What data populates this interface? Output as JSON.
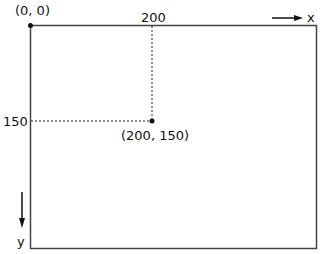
{
  "diagram": {
    "type": "screen coordinate system",
    "origin_label": "(0, 0)",
    "x_tick_label": "200",
    "y_tick_label": "150",
    "point_label": "(200, 150)",
    "x_axis_label": "x",
    "y_axis_label": "y",
    "point": {
      "x": 200,
      "y": 150
    },
    "colors": {
      "line": "#222222",
      "background": "#ffffff"
    }
  }
}
